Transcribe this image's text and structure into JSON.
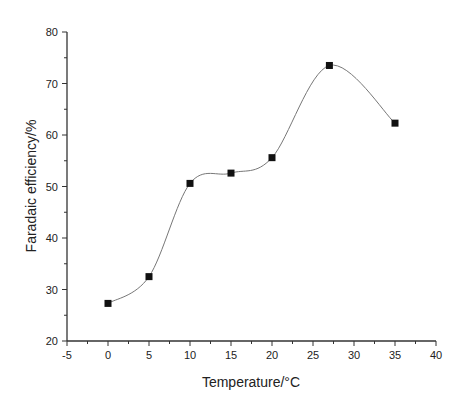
{
  "chart_data": {
    "type": "scatter",
    "title": "",
    "xlabel": "Temperature/°C",
    "ylabel": "Faradaic efficiency/%",
    "xlim": [
      -5,
      40
    ],
    "ylim": [
      20,
      80
    ],
    "xticks": [
      -5,
      0,
      5,
      10,
      15,
      20,
      25,
      30,
      35,
      40
    ],
    "yticks": [
      20,
      30,
      40,
      50,
      60,
      70,
      80
    ],
    "grid": false,
    "legend": null,
    "series": [
      {
        "name": "Faradaic efficiency",
        "marker": "square",
        "line": "smooth spline",
        "x": [
          0,
          5,
          10,
          15,
          20,
          27,
          35
        ],
        "y": [
          27.3,
          32.5,
          50.6,
          52.6,
          55.6,
          73.5,
          62.3
        ]
      }
    ]
  },
  "colors": {
    "axis": "#333333",
    "marker": "#111111",
    "curve": "#777777"
  }
}
